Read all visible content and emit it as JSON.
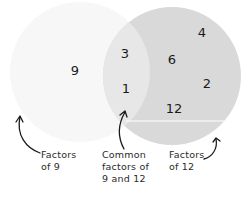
{
  "diagram": {
    "type": "venn",
    "colors": {
      "left_only": "#f7f7f7",
      "right_only": "#d9d9d9",
      "overlap": "#e7e7e7",
      "divider": "#ffffff",
      "text": "#1a1a1a",
      "arrow": "#1a1a1a"
    },
    "sets": {
      "left": {
        "name": "Factors of 9",
        "only_members": [
          "9"
        ]
      },
      "right": {
        "name": "Factors of 12",
        "only_members": [
          "4",
          "6",
          "2",
          "12"
        ]
      },
      "overlap": {
        "name": "Common factors of 9 and 12",
        "members": [
          "3",
          "1"
        ]
      }
    },
    "numbers": {
      "n9": "9",
      "n3": "3",
      "n1": "1",
      "n6": "6",
      "n4": "4",
      "n2": "2",
      "n12": "12"
    },
    "labels": {
      "left": [
        "Factors",
        "of 9"
      ],
      "overlap": [
        "Common",
        "factors of",
        "9 and 12"
      ],
      "right": [
        "Factors",
        "of 12"
      ]
    }
  }
}
